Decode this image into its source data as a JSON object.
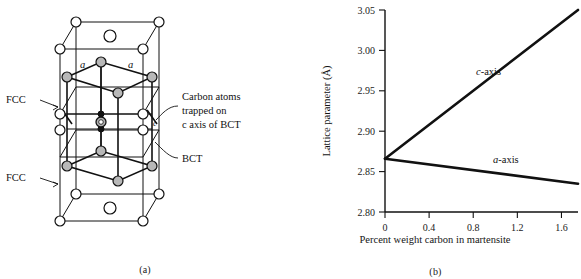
{
  "figure": {
    "panel_a": {
      "caption": "(a)",
      "labels": {
        "fcc_upper": "FCC",
        "fcc_lower": "FCC",
        "bct": "BCT",
        "carbon_note_line1": "Carbon atoms",
        "carbon_note_line2": "trapped on",
        "carbon_note_line3": "c axis of BCT",
        "edge_a_left": "a",
        "edge_a_right": "a",
        "edge_c": "c"
      },
      "legend_semantics": {
        "open_circle": "iron-atom-fcc",
        "gray_circle": "iron-atom-bct",
        "solid_dot": "iron-atom-interior",
        "hatched_circle": "carbon-atom"
      }
    },
    "panel_b": {
      "caption": "(b)"
    }
  },
  "chart_data": {
    "type": "line",
    "title": "",
    "xlabel": "Percent weight carbon in martensite",
    "ylabel": "Lattice parameter (Å)",
    "xlim": [
      0,
      1.75
    ],
    "ylim": [
      2.8,
      3.05
    ],
    "xticks": [
      0,
      0.4,
      0.8,
      1.2,
      1.6
    ],
    "xticklabels": [
      "0",
      "0.4",
      "0.8",
      "1.2",
      "1.6"
    ],
    "yticks": [
      2.8,
      2.85,
      2.9,
      2.95,
      3.0,
      3.05
    ],
    "yticklabels": [
      "2.80",
      "2.85",
      "2.90",
      "2.95",
      "3.00",
      "3.05"
    ],
    "grid": false,
    "legend_position": "inline-annotation",
    "series": [
      {
        "name": "c-axis",
        "label": "c-axis",
        "color": "#111111",
        "x": [
          0,
          1.75
        ],
        "values": [
          2.866,
          3.05
        ]
      },
      {
        "name": "a-axis",
        "label": "a-axis",
        "color": "#111111",
        "x": [
          0,
          1.75
        ],
        "values": [
          2.866,
          2.835
        ]
      }
    ]
  }
}
